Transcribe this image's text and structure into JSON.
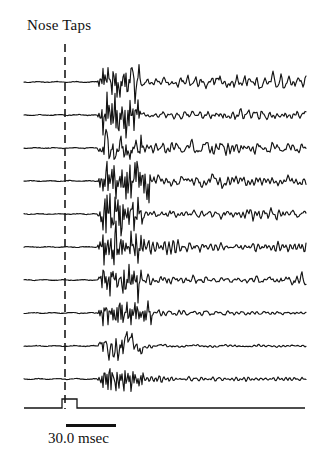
{
  "figure": {
    "title": "Nose Taps",
    "background_color": "#ffffff",
    "trace_color": "#141414",
    "marker_color": "#1a1a1a"
  },
  "scale_bar": {
    "label": "30.0 msec",
    "x_start_px": 66,
    "x_end_px": 116,
    "duration_msec": 30.0
  },
  "stimulus_marker": {
    "name": "stimulus-onset",
    "style": "dashed-vertical",
    "x_px": 65,
    "y_top_px": 44,
    "y_bottom_px": 409,
    "dash_on_px": 8,
    "dash_off_px": 5
  },
  "stimulus_pulse": {
    "name": "tap-pulse",
    "baseline_y_px": 408,
    "pulse_start_x_px": 62,
    "pulse_end_x_px": 77,
    "pulse_height_px": 9,
    "trace_start_x_px": 24,
    "trace_end_x_px": 305
  },
  "chart_data": {
    "type": "line",
    "title": "Nose Taps",
    "xlabel": "",
    "ylabel": "",
    "legend_position": "none",
    "grid": false,
    "x_axis": {
      "units": "msec",
      "scale_bar_msec": 30.0,
      "scale_bar_px": 50,
      "trace_start_px": 24,
      "trace_end_px": 306,
      "stimulus_onset_px": 65,
      "burst_onset_px": 100
    },
    "n_traces": 10,
    "baseline_spacing_px": 33,
    "trace_baselines_px": [
      82,
      115,
      148,
      181,
      214,
      247,
      280,
      313,
      346,
      379
    ],
    "series": [
      {
        "name": "trace-1",
        "baseline_y_px": 82,
        "pre_stimulus": "flat",
        "burst_amplitude_px": 30,
        "post_burst_amplitude_px": 14,
        "post_burst_character": "sustained-high-frequency",
        "seed": 11
      },
      {
        "name": "trace-2",
        "baseline_y_px": 115,
        "pre_stimulus": "flat",
        "burst_amplitude_px": 30,
        "post_burst_amplitude_px": 11,
        "post_burst_character": "sustained-medium",
        "seed": 23
      },
      {
        "name": "trace-3",
        "baseline_y_px": 148,
        "pre_stimulus": "flat",
        "burst_amplitude_px": 30,
        "post_burst_amplitude_px": 13,
        "post_burst_character": "sustained-high-frequency",
        "seed": 37
      },
      {
        "name": "trace-4",
        "baseline_y_px": 181,
        "pre_stimulus": "flat",
        "burst_amplitude_px": 29,
        "post_burst_amplitude_px": 13,
        "post_burst_character": "sustained-high-frequency",
        "seed": 51
      },
      {
        "name": "trace-5",
        "baseline_y_px": 214,
        "pre_stimulus": "flat",
        "burst_amplitude_px": 30,
        "post_burst_amplitude_px": 10,
        "post_burst_character": "sustained-medium",
        "seed": 67
      },
      {
        "name": "trace-6",
        "baseline_y_px": 247,
        "pre_stimulus": "flat",
        "burst_amplitude_px": 30,
        "post_burst_amplitude_px": 13,
        "post_burst_character": "sustained-high-frequency",
        "seed": 83
      },
      {
        "name": "trace-7",
        "baseline_y_px": 280,
        "pre_stimulus": "flat",
        "burst_amplitude_px": 29,
        "post_burst_amplitude_px": 12,
        "post_burst_character": "sustained-high-frequency",
        "seed": 97
      },
      {
        "name": "trace-8",
        "baseline_y_px": 313,
        "pre_stimulus": "flat",
        "burst_amplitude_px": 24,
        "post_burst_amplitude_px": 6,
        "post_burst_character": "decaying",
        "seed": 113
      },
      {
        "name": "trace-9",
        "baseline_y_px": 346,
        "pre_stimulus": "flat",
        "burst_amplitude_px": 25,
        "post_burst_amplitude_px": 3,
        "post_burst_character": "strongly-decaying",
        "seed": 131
      },
      {
        "name": "trace-10",
        "baseline_y_px": 379,
        "pre_stimulus": "flat",
        "burst_amplitude_px": 22,
        "post_burst_amplitude_px": 6,
        "post_burst_character": "decaying",
        "seed": 149
      }
    ]
  }
}
